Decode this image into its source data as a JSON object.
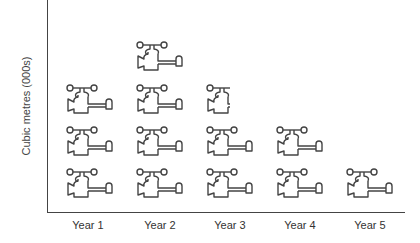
{
  "chart_data": {
    "type": "pictogram",
    "title": "",
    "xlabel": "",
    "ylabel": "Cubic metres (000s)",
    "categories": [
      "Year 1",
      "Year 2",
      "Year 3",
      "Year 4",
      "Year 5"
    ],
    "values": [
      3,
      4,
      2.5,
      2,
      1
    ],
    "unit_icon": "water-tap-icon",
    "unit_note": "each tap icon = one unit; Year 3 shows a half icon",
    "grid": false,
    "legend": null
  }
}
